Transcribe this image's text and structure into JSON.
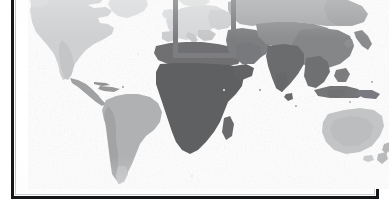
{
  "figure": {
    "kind": "world-map",
    "projection_label": "",
    "caption": "",
    "background_color": "#ffffff",
    "frame_color": "#15161a",
    "frame_hairline_color": "#b9bcc0",
    "ocean_color": "#ffffff"
  },
  "highlight_box": {
    "name": "europe-region-highlight",
    "label": "",
    "stroke_color": "#7b7d80",
    "stroke_width_px": 5,
    "left_px": 145,
    "top_px": -4,
    "width_px": 63,
    "height_px": 68
  },
  "shading_scale": {
    "type": "grayscale-choropleth",
    "lightest_color": "#e2e3e4",
    "light_color": "#cfd0d1",
    "medium_color": "#a9aaac",
    "dark_color": "#7e7f81",
    "darkest_color": "#5d5e60"
  },
  "regions": [
    {
      "name": "north-america",
      "shade": "#cfd0d1"
    },
    {
      "name": "greenland",
      "shade": "#d9dadb"
    },
    {
      "name": "central-america",
      "shade": "#a0a1a3"
    },
    {
      "name": "caribbean",
      "shade": "#96989a"
    },
    {
      "name": "south-america",
      "shade": "#b0b1b3"
    },
    {
      "name": "europe",
      "shade": "#d6d7d8"
    },
    {
      "name": "scandinavia",
      "shade": "#dcdddd"
    },
    {
      "name": "north-africa",
      "shade": "#6f7072"
    },
    {
      "name": "sub-saharan-africa",
      "shade": "#5f6062"
    },
    {
      "name": "madagascar",
      "shade": "#6a6b6d"
    },
    {
      "name": "middle-east",
      "shade": "#7d7e80"
    },
    {
      "name": "russia-north-asia",
      "shade": "#a8a9ab"
    },
    {
      "name": "central-asia",
      "shade": "#8e8f91"
    },
    {
      "name": "south-asia",
      "shade": "#6b6c6e"
    },
    {
      "name": "east-asia",
      "shade": "#858688"
    },
    {
      "name": "southeast-asia",
      "shade": "#6e6f71"
    },
    {
      "name": "indonesia",
      "shade": "#747577"
    },
    {
      "name": "japan",
      "shade": "#8a8b8d"
    },
    {
      "name": "australia",
      "shade": "#c3c4c6"
    },
    {
      "name": "new-zealand",
      "shade": "#b6b7b9"
    }
  ],
  "chart_data": {
    "type": "map",
    "title": "",
    "subtitle": "",
    "xlabel": "",
    "ylabel": "",
    "legend": [],
    "annotations": [
      {
        "kind": "rectangle-highlight",
        "target": "Europe",
        "text": "",
        "x_px": 145,
        "y_px": -4,
        "width_px": 63,
        "height_px": 68,
        "color": "#7b7d80"
      }
    ],
    "series": [
      {
        "name": "grayscale-intensity-by-region",
        "categories": [
          "North America",
          "Greenland",
          "Central America",
          "Caribbean",
          "South America",
          "Europe",
          "Scandinavia",
          "North Africa",
          "Sub-Saharan Africa",
          "Madagascar",
          "Middle East",
          "Russia / North Asia",
          "Central Asia",
          "South Asia",
          "East Asia",
          "Southeast Asia",
          "Indonesia",
          "Japan",
          "Australia",
          "New Zealand"
        ],
        "values": [
          "#cfd0d1",
          "#d9dadb",
          "#a0a1a3",
          "#96989a",
          "#b0b1b3",
          "#d6d7d8",
          "#dcdddd",
          "#6f7072",
          "#5f6062",
          "#6a6b6d",
          "#7d7e80",
          "#a8a9ab",
          "#8e8f91",
          "#6b6c6e",
          "#858688",
          "#6e6f71",
          "#747577",
          "#8a8b8d",
          "#c3c4c6",
          "#b6b7b9"
        ]
      }
    ],
    "grid": false,
    "legend_position": "none"
  },
  "accessibility": {
    "figure_description": "Grayscale world map with a gray rectangular box outlining Europe"
  }
}
